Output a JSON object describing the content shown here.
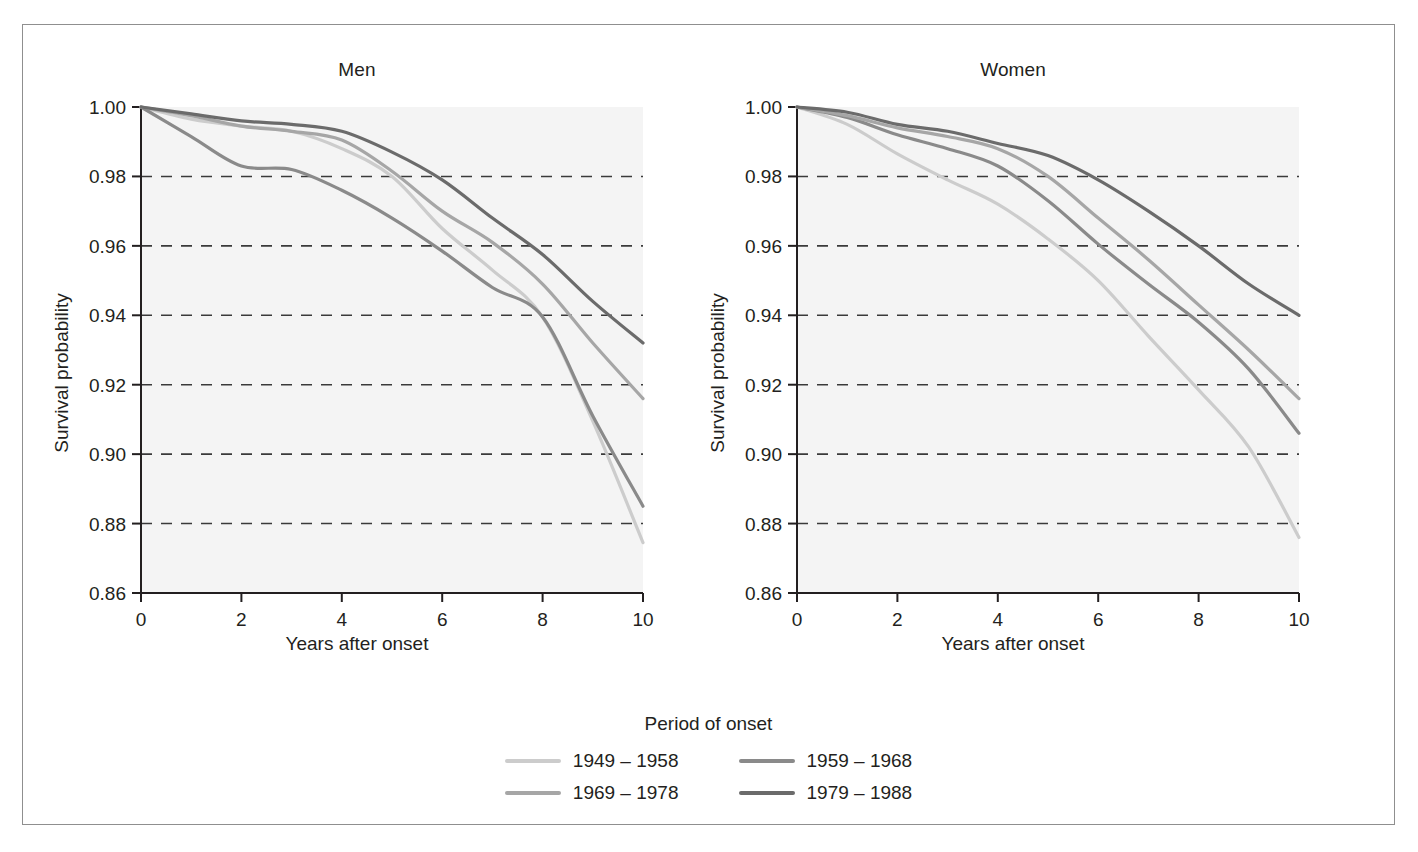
{
  "figure": {
    "ylabel": "Survival probability",
    "xlabel": "Years after onset",
    "panels": [
      {
        "key": "men",
        "title": "Men"
      },
      {
        "key": "women",
        "title": "Women"
      }
    ]
  },
  "legend": {
    "title": "Period of onset",
    "items": [
      {
        "label": "1949 – 1958",
        "color": "#cccccc"
      },
      {
        "label": "1959 – 1968",
        "color": "#8a8a8a"
      },
      {
        "label": "1969 – 1978",
        "color": "#a6a6a6"
      },
      {
        "label": "1979 – 1988",
        "color": "#6b6b6b"
      }
    ]
  },
  "chart_data": {
    "type": "line",
    "xlabel": "Years after onset",
    "ylabel": "Survival probability",
    "xlim": [
      0,
      10
    ],
    "ylim": [
      0.86,
      1.0
    ],
    "xticks": [
      0,
      2,
      4,
      6,
      8,
      10
    ],
    "yticks": [
      0.86,
      0.88,
      0.9,
      0.92,
      0.94,
      0.96,
      0.98,
      1.0
    ],
    "ytick_labels": [
      "0.86",
      "0.88",
      "0.90",
      "0.92",
      "0.94",
      "0.96",
      "0.98",
      "1.00"
    ],
    "xtick_labels": [
      "0",
      "2",
      "4",
      "6",
      "8",
      "10"
    ],
    "grid": "horizontal-dashed",
    "gridlines_at": [
      0.88,
      0.9,
      0.92,
      0.94,
      0.96,
      0.98
    ],
    "legend_title": "Period of onset",
    "legend_position": "bottom-center",
    "panels": [
      {
        "name": "Men",
        "x": [
          0,
          1,
          2,
          3,
          4,
          5,
          6,
          7,
          8,
          9,
          10
        ],
        "series": [
          {
            "name": "1949 – 1958",
            "color": "#cccccc",
            "values": [
              1.0,
              0.9965,
              0.9945,
              0.993,
              0.988,
              0.98,
              0.965,
              0.953,
              0.9395,
              0.9095,
              0.8745
            ]
          },
          {
            "name": "1959 – 1968",
            "color": "#8a8a8a",
            "values": [
              1.0,
              0.9915,
              0.983,
              0.982,
              0.976,
              0.968,
              0.9585,
              0.948,
              0.9395,
              0.911,
              0.885
            ]
          },
          {
            "name": "1969 – 1978",
            "color": "#a6a6a6",
            "values": [
              1.0,
              0.9975,
              0.9945,
              0.993,
              0.9905,
              0.9815,
              0.97,
              0.961,
              0.949,
              0.932,
              0.916
            ]
          },
          {
            "name": "1979 – 1988",
            "color": "#6b6b6b",
            "values": [
              1.0,
              0.998,
              0.996,
              0.995,
              0.993,
              0.987,
              0.979,
              0.968,
              0.9575,
              0.944,
              0.932
            ]
          }
        ]
      },
      {
        "name": "Women",
        "x": [
          0,
          1,
          2,
          3,
          4,
          5,
          6,
          7,
          8,
          9,
          10
        ],
        "series": [
          {
            "name": "1949 – 1958",
            "color": "#cccccc",
            "values": [
              1.0,
              0.995,
              0.9865,
              0.979,
              0.972,
              0.962,
              0.95,
              0.934,
              0.9185,
              0.902,
              0.876
            ]
          },
          {
            "name": "1959 – 1968",
            "color": "#8a8a8a",
            "values": [
              1.0,
              0.997,
              0.992,
              0.988,
              0.983,
              0.973,
              0.9605,
              0.949,
              0.938,
              0.9245,
              0.906
            ]
          },
          {
            "name": "1969 – 1978",
            "color": "#a6a6a6",
            "values": [
              1.0,
              0.9975,
              0.994,
              0.9915,
              0.988,
              0.98,
              0.968,
              0.956,
              0.943,
              0.93,
              0.916
            ]
          },
          {
            "name": "1979 – 1988",
            "color": "#6b6b6b",
            "values": [
              1.0,
              0.9985,
              0.995,
              0.993,
              0.9895,
              0.986,
              0.979,
              0.97,
              0.96,
              0.949,
              0.94
            ]
          }
        ]
      }
    ]
  }
}
